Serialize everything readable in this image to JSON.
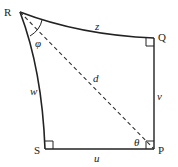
{
  "diagram": {
    "vertices": [
      {
        "id": "R",
        "label": "R"
      },
      {
        "id": "Q",
        "label": "Q"
      },
      {
        "id": "P",
        "label": "P"
      },
      {
        "id": "S",
        "label": "S"
      }
    ],
    "edges": [
      {
        "from": "R",
        "to": "Q",
        "label": "z",
        "style": "curved"
      },
      {
        "from": "Q",
        "to": "P",
        "label": "v",
        "style": "straight"
      },
      {
        "from": "P",
        "to": "S",
        "label": "u",
        "style": "straight"
      },
      {
        "from": "S",
        "to": "R",
        "label": "w",
        "style": "curved"
      },
      {
        "from": "R",
        "to": "P",
        "label": "d",
        "style": "dashed"
      }
    ],
    "angles": [
      {
        "at": "R",
        "label": "φ"
      },
      {
        "at": "P",
        "label": "θ"
      }
    ],
    "right_angles": [
      "Q",
      "P",
      "S"
    ],
    "colors": {
      "stroke": "#222222",
      "background": "#ffffff"
    }
  }
}
